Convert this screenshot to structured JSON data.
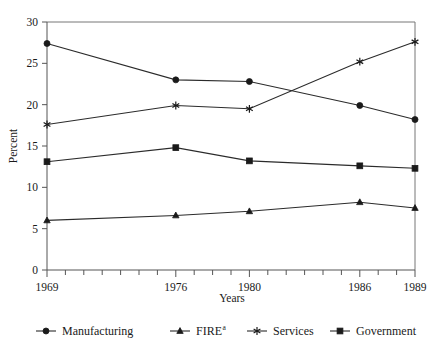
{
  "chart_data": {
    "type": "line",
    "title": "",
    "xlabel": "Years",
    "ylabel": "Percent",
    "x": [
      1969,
      1976,
      1980,
      1986,
      1989
    ],
    "xlim": [
      1969,
      1989
    ],
    "ylim": [
      0,
      30
    ],
    "ytick_labels": [
      "0",
      "5",
      "10",
      "15",
      "20",
      "25",
      "30"
    ],
    "ytick_values": [
      0,
      5,
      10,
      15,
      20,
      25,
      30
    ],
    "xtick_labels": [
      "1969",
      "1976",
      "1980",
      "1986",
      "1989"
    ],
    "xtick_values": [
      1969,
      1976,
      1980,
      1986,
      1989
    ],
    "xminor_ticks": [
      1969,
      1970,
      1971,
      1972,
      1973,
      1974,
      1975,
      1976,
      1977,
      1978,
      1979,
      1980,
      1981,
      1982,
      1983,
      1984,
      1985,
      1986,
      1987,
      1988,
      1989
    ],
    "grid": false,
    "legend_position": "bottom",
    "series": [
      {
        "name": "Manufacturing",
        "marker": "circle",
        "values": [
          27.4,
          23.0,
          22.8,
          19.9,
          18.2
        ]
      },
      {
        "name": "FIRE",
        "name_superscript": "a",
        "marker": "triangle",
        "values": [
          6.0,
          6.6,
          7.1,
          8.2,
          7.5
        ]
      },
      {
        "name": "Services",
        "marker": "star",
        "values": [
          17.6,
          19.9,
          19.5,
          25.2,
          27.6
        ]
      },
      {
        "name": "Government",
        "marker": "square",
        "values": [
          13.1,
          14.8,
          13.2,
          12.6,
          12.3
        ]
      }
    ]
  },
  "legend": {
    "items": [
      {
        "label": "Manufacturing",
        "superscript": "",
        "marker": "circle-marker-icon"
      },
      {
        "label": "FIRE",
        "superscript": "a",
        "marker": "triangle-marker-icon"
      },
      {
        "label": "Services",
        "superscript": "",
        "marker": "star-marker-icon"
      },
      {
        "label": "Government",
        "superscript": "",
        "marker": "square-marker-icon"
      }
    ]
  },
  "colors": {
    "line": "#2b2b2b",
    "marker": "#1a1a1a",
    "axis": "#555555",
    "frame": "#777777",
    "background": "#ffffff"
  }
}
